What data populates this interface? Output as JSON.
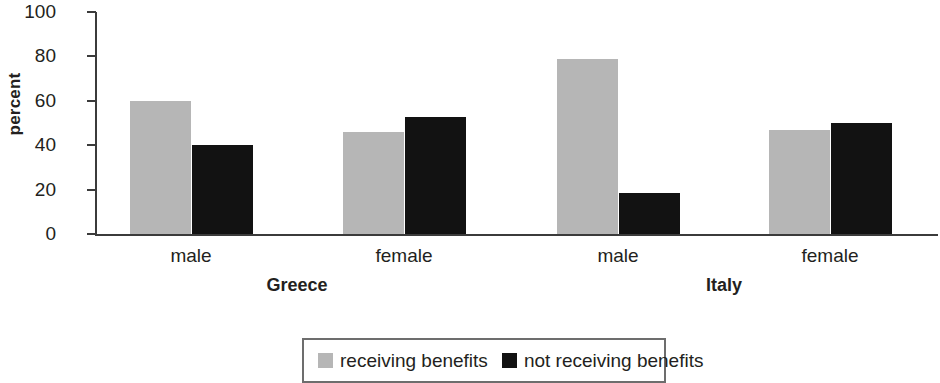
{
  "chart_data": {
    "type": "bar",
    "title": "",
    "xlabel": "",
    "ylabel": "percent",
    "ylim": [
      0,
      100
    ],
    "yticks": [
      0,
      20,
      40,
      60,
      80,
      100
    ],
    "ytick_labels": [
      "0",
      "20",
      "40",
      "60",
      "80",
      "100"
    ],
    "grid": false,
    "legend_position": "bottom-center",
    "groups": [
      "Greece",
      "Italy"
    ],
    "categories": [
      "male",
      "female",
      "male",
      "female"
    ],
    "category_groups": [
      "Greece",
      "Greece",
      "Italy",
      "Italy"
    ],
    "series": [
      {
        "name": "receiving benefits",
        "color": "#b6b6b6",
        "values": [
          60,
          46,
          79,
          47
        ]
      },
      {
        "name": "not receiving benefits",
        "color": "#121212",
        "values": [
          40,
          52.5,
          18.5,
          50
        ]
      }
    ],
    "bars": [
      {
        "group": "Greece",
        "category": "male",
        "series": "receiving benefits",
        "value": 60,
        "color": "#b6b6b6",
        "x": 130,
        "width": 61
      },
      {
        "group": "Greece",
        "category": "male",
        "series": "not receiving benefits",
        "value": 40,
        "color": "#121212",
        "x": 192,
        "width": 61
      },
      {
        "group": "Greece",
        "category": "female",
        "series": "receiving benefits",
        "value": 46,
        "color": "#b6b6b6",
        "x": 343,
        "width": 61
      },
      {
        "group": "Greece",
        "category": "female",
        "series": "not receiving benefits",
        "value": 52.5,
        "color": "#121212",
        "x": 405,
        "width": 61
      },
      {
        "group": "Italy",
        "category": "male",
        "series": "receiving benefits",
        "value": 79,
        "color": "#b6b6b6",
        "x": 557,
        "width": 61
      },
      {
        "group": "Italy",
        "category": "male",
        "series": "not receiving benefits",
        "value": 18.5,
        "color": "#121212",
        "x": 619,
        "width": 61
      },
      {
        "group": "Italy",
        "category": "female",
        "series": "receiving benefits",
        "value": 47,
        "color": "#b6b6b6",
        "x": 769,
        "width": 61
      },
      {
        "group": "Italy",
        "category": "female",
        "series": "not receiving benefits",
        "value": 50,
        "color": "#121212",
        "x": 831,
        "width": 61
      }
    ],
    "x_label_positions": [
      {
        "label": "male",
        "center": 191
      },
      {
        "label": "female",
        "center": 404
      },
      {
        "label": "male",
        "center": 618
      },
      {
        "label": "female",
        "center": 830
      }
    ],
    "group_label_positions": [
      {
        "label": "Greece",
        "center": 297
      },
      {
        "label": "Italy",
        "center": 724
      }
    ]
  },
  "legend": {
    "items": [
      {
        "label": "receiving benefits",
        "color": "#b6b6b6"
      },
      {
        "label": "not receiving benefits",
        "color": "#121212"
      }
    ]
  }
}
